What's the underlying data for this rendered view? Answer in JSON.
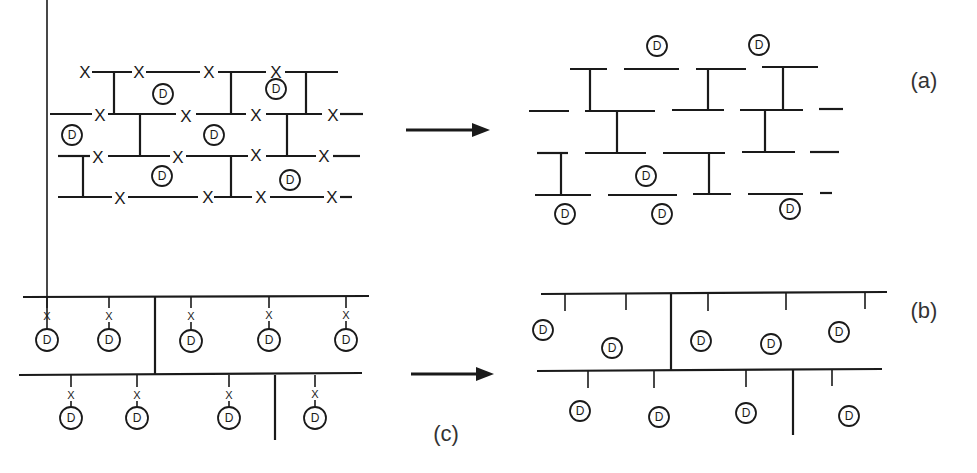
{
  "figure": {
    "colors": {
      "ink": "#1a1a1a",
      "label": "#333333",
      "background": "#ffffff"
    }
  },
  "labels": {
    "panel_a": "(a)",
    "panel_b": "(b)",
    "panel_c": "(c)",
    "cleavage_mark": "X",
    "drug_mark": "D"
  },
  "panels": {
    "a_before": {
      "description": "Network with chains joined by crosslinks; cleavable sites marked X along chains; drug D entrapped in mesh",
      "cleavage_sites": 19,
      "drug_count": 6
    },
    "a_after": {
      "description": "Chains fragmented at X sites; drug D released",
      "drug_count": 6
    },
    "c_before": {
      "description": "Two backbone chains with pendant drug D attached via cleavable linkers X",
      "pendant_drugs": 9
    },
    "b_after": {
      "description": "Linkers cleaved; free drug D released from backbone",
      "free_drugs": 9
    }
  }
}
